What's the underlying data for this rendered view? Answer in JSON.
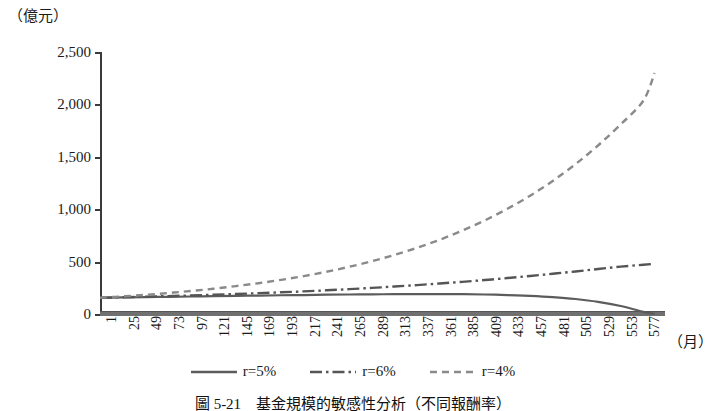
{
  "chart_data": {
    "type": "line",
    "title": "",
    "ylabel": "（億元）",
    "xlabel": "（月）",
    "ylim": [
      0,
      2500
    ],
    "xlim": [
      1,
      600
    ],
    "grid": false,
    "legend_position": "bottom",
    "yticks": [
      "0",
      "500",
      "1,000",
      "1,500",
      "2,000",
      "2,500"
    ],
    "ytick_values": [
      0,
      500,
      1000,
      1500,
      2000,
      2500
    ],
    "xticks": [
      "1",
      "25",
      "49",
      "73",
      "97",
      "121",
      "145",
      "169",
      "193",
      "217",
      "241",
      "265",
      "289",
      "313",
      "337",
      "361",
      "385",
      "409",
      "433",
      "457",
      "481",
      "505",
      "529",
      "553",
      "577"
    ],
    "xtick_values": [
      1,
      25,
      49,
      73,
      97,
      121,
      145,
      169,
      193,
      217,
      241,
      265,
      289,
      313,
      337,
      361,
      385,
      409,
      433,
      457,
      481,
      505,
      529,
      553,
      577
    ],
    "series": [
      {
        "name": "r=5%",
        "style": "solid",
        "color": "#5c5c5c",
        "x": [
          1,
          25,
          49,
          73,
          97,
          121,
          145,
          169,
          193,
          217,
          241,
          265,
          289,
          313,
          337,
          361,
          385,
          409,
          433,
          457,
          481,
          505,
          529,
          553,
          577,
          589
        ],
        "values": [
          155,
          158,
          161,
          164,
          167,
          170,
          173,
          176,
          179,
          181,
          184,
          186,
          188,
          189,
          190,
          190,
          189,
          186,
          181,
          173,
          161,
          143,
          116,
          76,
          20,
          0
        ]
      },
      {
        "name": "r=6%",
        "style": "dashdot",
        "color": "#555555",
        "x": [
          1,
          25,
          49,
          73,
          97,
          121,
          145,
          169,
          193,
          217,
          241,
          265,
          289,
          313,
          337,
          361,
          385,
          409,
          433,
          457,
          481,
          505,
          529,
          553,
          577,
          589
        ],
        "values": [
          155,
          160,
          165,
          171,
          177,
          184,
          191,
          199,
          207,
          216,
          226,
          237,
          249,
          262,
          276,
          291,
          307,
          324,
          343,
          363,
          384,
          406,
          429,
          452,
          470,
          478
        ]
      },
      {
        "name": "r=4%",
        "style": "dashed",
        "color": "#8a8a8a",
        "x": [
          1,
          25,
          49,
          73,
          97,
          121,
          145,
          169,
          193,
          217,
          241,
          265,
          289,
          313,
          337,
          361,
          385,
          409,
          433,
          457,
          481,
          505,
          529,
          553,
          577,
          589
        ],
        "values": [
          155,
          168,
          183,
          200,
          219,
          241,
          266,
          294,
          326,
          362,
          403,
          450,
          503,
          563,
          631,
          708,
          795,
          893,
          1004,
          1129,
          1270,
          1429,
          1608,
          1809,
          2035,
          2300
        ]
      }
    ]
  },
  "legend": {
    "items": [
      {
        "label": "r=5%",
        "style": "solid",
        "color": "#5c5c5c"
      },
      {
        "label": "r=6%",
        "style": "dashdot",
        "color": "#555555"
      },
      {
        "label": "r=4%",
        "style": "dashed",
        "color": "#8a8a8a"
      }
    ]
  },
  "caption": {
    "text": "圖 5-21　基金規模的敏感性分析（不同報酬率）"
  },
  "axis_unit_y": "（億元）",
  "axis_unit_x": "（月）"
}
